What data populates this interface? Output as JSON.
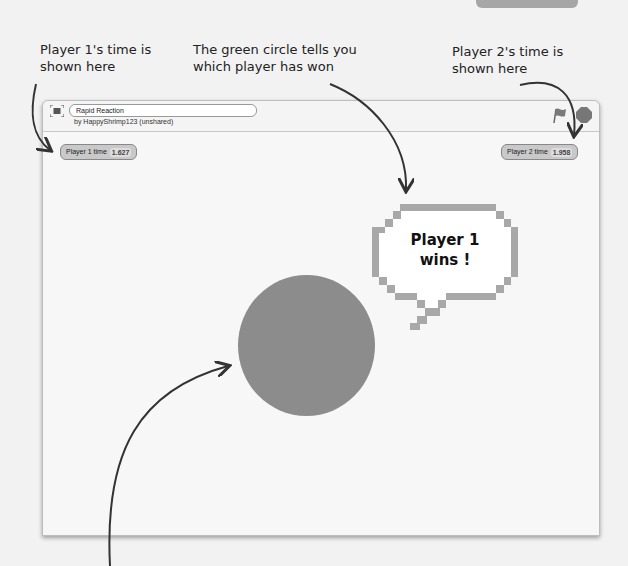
{
  "annotations": {
    "p1_line1": "Player 1's time is",
    "p1_line2": "shown here",
    "green_line1": "The green circle tells you",
    "green_line2": "which player has won",
    "p2_line1": "Player 2's time is",
    "p2_line2": "shown here"
  },
  "project": {
    "title": "Rapid Reaction",
    "author": "by HappyShrimp123 (unshared)"
  },
  "monitors": {
    "player1": {
      "label": "Player 1 time",
      "value": "1.627"
    },
    "player2": {
      "label": "Player 2 time",
      "value": "1.958"
    }
  },
  "speech_bubble": {
    "line1": "Player 1",
    "line2": "wins !"
  },
  "colors": {
    "circle": "#8c8c8c",
    "bubble_border": "#a8a8a8"
  }
}
